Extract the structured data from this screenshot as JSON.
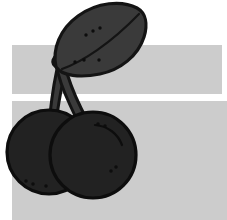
{
  "image": {
    "title": "Cherries",
    "subject": "cherry-pair-with-leaf",
    "style": "flat-clipart-silhouette",
    "width": 227,
    "height": 220,
    "background_color": "#ffffff"
  },
  "palette": {
    "background": "#ffffff",
    "band_gray": "#cccccc",
    "leaf_fill": "#3a3a3a",
    "leaf_outline": "#141414",
    "stem_fill": "#3a3a3a",
    "stem_outline": "#141414",
    "cherry_fill": "#222222",
    "cherry_outline": "#0d0d0d",
    "detail_mark": "#0d0d0d",
    "highlight_stroke": "#4a4a4a"
  },
  "bands": [
    {
      "name": "upper-band",
      "x": 12,
      "y": 45,
      "width": 210,
      "height": 49,
      "color": "#cccccc"
    },
    {
      "name": "lower-band",
      "x": 12,
      "y": 101,
      "width": 215,
      "height": 119,
      "color": "#cccccc"
    }
  ],
  "shapes": {
    "leaf": {
      "label": "Leaf",
      "fill": "#3a3a3a",
      "stroke": "#141414",
      "stroke_width": 3.2,
      "path": "M 56 67 C 52 49 60 29 78 16 C 97 2 122 0 137 8 C 146 13 148 24 144 37 C 138 56 120 70 100 74 C 80 78 62 76 56 67 Z",
      "vein_path": "M 62 69 C 82 62 110 44 139 14",
      "dots": [
        {
          "cx": 86,
          "cy": 35,
          "r": 1.7
        },
        {
          "cx": 93,
          "cy": 31,
          "r": 1.7
        },
        {
          "cx": 100,
          "cy": 28,
          "r": 1.7
        },
        {
          "cx": 75,
          "cy": 62,
          "r": 1.7
        },
        {
          "cx": 84,
          "cy": 60,
          "r": 1.7
        },
        {
          "cx": 99,
          "cy": 60,
          "r": 1.7
        }
      ]
    },
    "stem_left": {
      "label": "Left stem",
      "fill": "#3a3a3a",
      "stroke": "#141414",
      "stroke_width": 3.0,
      "path": "M 59 61 C 55 76 52 96 50 114 C 49 122 48 128 48 130 L 56 130 C 56 124 57 114 59 102 C 62 84 65 72 68 63 Z"
    },
    "stem_right": {
      "label": "Right stem",
      "fill": "#3a3a3a",
      "stroke": "#141414",
      "stroke_width": 3.0,
      "path": "M 64 63 C 68 78 74 94 81 108 C 85 116 88 122 90 126 L 82 130 C 79 124 75 116 70 105 C 63 90 58 75 56 64 Z"
    },
    "stem_junction": {
      "label": "Stem junction",
      "path": "M 53 60 C 55 55 60 52 66 53 C 72 54 74 58 73 63 C 71 68 63 70 58 68 C 54 66 52 63 53 60 Z"
    },
    "cherry_left": {
      "label": "Left cherry",
      "cx": 49,
      "cy": 152,
      "r": 42,
      "fill": "#222222",
      "stroke": "#0d0d0d",
      "stroke_width": 3.2,
      "dots": [
        {
          "cx": 26,
          "cy": 181,
          "r": 1.7
        },
        {
          "cx": 33,
          "cy": 184,
          "r": 1.7
        },
        {
          "cx": 46,
          "cy": 186,
          "r": 1.7
        }
      ]
    },
    "cherry_right": {
      "label": "Right cherry",
      "cx": 93,
      "cy": 155,
      "r": 43,
      "fill": "#222222",
      "stroke": "#0d0d0d",
      "stroke_width": 3.2,
      "highlight_path": "M 95 125 C 108 126 118 134 122 145",
      "dots": [
        {
          "cx": 98,
          "cy": 124,
          "r": 1.7
        },
        {
          "cx": 105,
          "cy": 126,
          "r": 1.7
        },
        {
          "cx": 111,
          "cy": 171,
          "r": 1.7
        },
        {
          "cx": 116,
          "cy": 167,
          "r": 1.7
        }
      ]
    }
  }
}
